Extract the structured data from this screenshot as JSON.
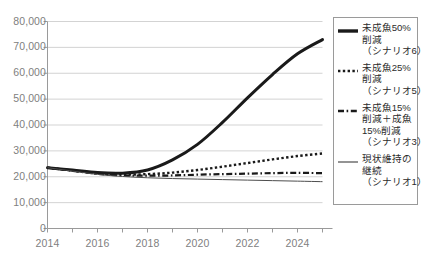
{
  "chart_data": {
    "type": "line",
    "title": "",
    "xlabel": "",
    "ylabel": "",
    "grid": true,
    "legend_position": "right",
    "xlim": [
      2014,
      2025
    ],
    "ylim": [
      0,
      80000
    ],
    "x_ticks": [
      2014,
      2016,
      2018,
      2020,
      2022,
      2024
    ],
    "x_tick_labels": [
      "2014",
      "2016",
      "2018",
      "2020",
      "2022",
      "2024"
    ],
    "y_ticks": [
      0,
      10000,
      20000,
      30000,
      40000,
      50000,
      60000,
      70000,
      80000
    ],
    "y_tick_labels": [
      "0",
      "10,000",
      "20,000",
      "30,000",
      "40,000",
      "50,000",
      "60,000",
      "70,000",
      "80,000"
    ],
    "x": [
      2014,
      2015,
      2016,
      2017,
      2018,
      2019,
      2020,
      2021,
      2022,
      2023,
      2024,
      2025
    ],
    "series": [
      {
        "name": "未成魚50%削減（シナリオ6）",
        "style": "solid-thick",
        "color": "#1a1a1a",
        "values": [
          23500,
          22600,
          21600,
          21400,
          22600,
          26500,
          32500,
          41000,
          50500,
          59500,
          67500,
          73000
        ]
      },
      {
        "name": "未成魚25%削減（シナリオ5）",
        "style": "dotted",
        "color": "#1a1a1a",
        "values": [
          23500,
          22400,
          21300,
          20900,
          21000,
          21600,
          22600,
          23900,
          25300,
          26700,
          28000,
          29000
        ]
      },
      {
        "name": "未成魚15%削減＋成魚15%削減（シナリオ3）",
        "style": "dashdot",
        "color": "#1a1a1a",
        "values": [
          23500,
          22300,
          21100,
          20500,
          20400,
          20500,
          20800,
          21000,
          21200,
          21400,
          21500,
          21400
        ]
      },
      {
        "name": "現状維持の継続（シナリオ1）",
        "style": "solid-thin",
        "color": "#4d4d4d",
        "values": [
          23500,
          22200,
          20900,
          20100,
          19600,
          19300,
          19100,
          18900,
          18700,
          18500,
          18300,
          18100
        ]
      }
    ]
  },
  "legend": {
    "entries": [
      {
        "swatch": "solid-thick-swatch",
        "lines": [
          "未成魚50%",
          "削減",
          "（シナリオ6）"
        ]
      },
      {
        "swatch": "dotted-swatch",
        "lines": [
          "未成魚25%",
          "削減",
          "（シナリオ5）"
        ]
      },
      {
        "swatch": "dashdot-swatch",
        "lines": [
          "未成魚15%",
          "削減＋成魚",
          "15%削減",
          "（シナリオ3）"
        ]
      },
      {
        "swatch": "solid-thin-swatch",
        "lines": [
          "現状維持の",
          "継続",
          "（シナリオ1）"
        ]
      }
    ]
  },
  "axis": {
    "y_labels": [
      "80,000",
      "70,000",
      "60,000",
      "50,000",
      "40,000",
      "30,000",
      "20,000",
      "10,000",
      "0"
    ],
    "x_labels": [
      "2014",
      "2016",
      "2018",
      "2020",
      "2022",
      "2024"
    ]
  }
}
